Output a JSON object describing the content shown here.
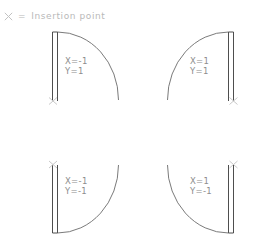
{
  "legend": {
    "glyph_icon": "x-cross-icon",
    "glyph_label": "X",
    "equals": "=",
    "text": "Insertion  point"
  },
  "colors": {
    "line_dark": "#3a3a3a",
    "line_mid": "#6b6b6b",
    "label_text": "#8d8d8d",
    "legend_text": "#b9b9b9",
    "marker": "#c9c9c9",
    "background": "#ffffff"
  },
  "figures": [
    {
      "id": "top-left",
      "x_label": "X=-1",
      "y_label": "Y=1",
      "insertion_point": "bottom-left",
      "arc_direction": "top-to-right"
    },
    {
      "id": "top-right",
      "x_label": "X=1",
      "y_label": "Y=1",
      "insertion_point": "bottom-right",
      "arc_direction": "top-to-left"
    },
    {
      "id": "bottom-left",
      "x_label": "X=-1",
      "y_label": "Y=-1",
      "insertion_point": "top-left",
      "arc_direction": "bottom-to-right"
    },
    {
      "id": "bottom-right",
      "x_label": "X=1",
      "y_label": "Y=-1",
      "insertion_point": "top-right",
      "arc_direction": "bottom-to-left"
    }
  ]
}
